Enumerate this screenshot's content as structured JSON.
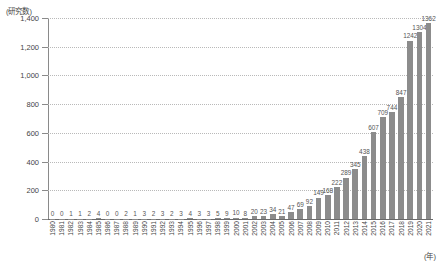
{
  "chart_data": {
    "type": "bar",
    "title": "",
    "ylabel": "(研究数)",
    "xlabel": "(年)",
    "ylim": [
      0,
      1400
    ],
    "yticks": [
      0,
      200,
      400,
      600,
      800,
      1000,
      1200,
      1400
    ],
    "ytick_labels": [
      "0",
      "200",
      "400",
      "600",
      "800",
      "1,000",
      "1,200",
      "1,400"
    ],
    "grid": true,
    "legend": "none",
    "bar_color": "#8c8c8c",
    "categories": [
      "1980",
      "1981",
      "1982",
      "1983",
      "1984",
      "1985",
      "1986",
      "1987",
      "1988",
      "1989",
      "1990",
      "1991",
      "1992",
      "1993",
      "1994",
      "1995",
      "1996",
      "1997",
      "1998",
      "1999",
      "2000",
      "2001",
      "2002",
      "2003",
      "2004",
      "2005",
      "2006",
      "2007",
      "2008",
      "2009",
      "2010",
      "2011",
      "2012",
      "2013",
      "2014",
      "2015",
      "2016",
      "2017",
      "2018",
      "2019",
      "2020",
      "2021"
    ],
    "values": [
      0,
      0,
      1,
      1,
      2,
      4,
      0,
      0,
      2,
      1,
      3,
      2,
      3,
      2,
      3,
      4,
      3,
      3,
      5,
      9,
      10,
      8,
      20,
      23,
      34,
      21,
      47,
      69,
      92,
      149,
      168,
      222,
      289,
      345,
      438,
      607,
      709,
      744,
      847,
      1242,
      1304,
      1362
    ],
    "value_labels": [
      "0",
      "0",
      "1",
      "1",
      "2",
      "4",
      "0",
      "0",
      "2",
      "1",
      "3",
      "2",
      "3",
      "2",
      "3",
      "4",
      "3",
      "3",
      "5",
      "9",
      "10",
      "8",
      "20",
      "23",
      "34",
      "21",
      "47",
      "69",
      "92",
      "149",
      "168",
      "222",
      "289",
      "345",
      "438",
      "607",
      "709",
      "744",
      "847",
      "1242",
      "1304",
      "1362"
    ]
  }
}
